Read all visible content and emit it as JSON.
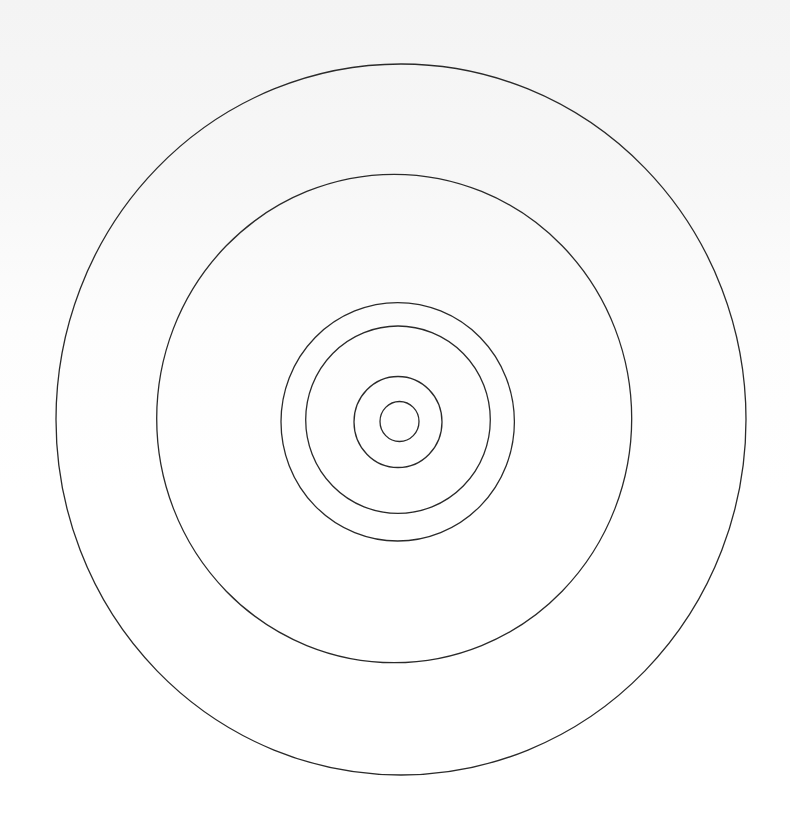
{
  "diagram": {
    "type": "concentric-circles",
    "stroke_color": "#2a2a2a",
    "background_color": "#ffffff",
    "rings": [
      {
        "name": "ring-1",
        "cx": 399.5,
        "cy": 421.5,
        "rx": 19.5,
        "ry": 20
      },
      {
        "name": "ring-2",
        "cx": 398,
        "cy": 422,
        "rx": 44,
        "ry": 45.5
      },
      {
        "name": "ring-3",
        "cx": 398,
        "cy": 419.7,
        "rx": 92.3,
        "ry": 93.7
      },
      {
        "name": "ring-4",
        "cx": 397.7,
        "cy": 421.8,
        "rx": 116.7,
        "ry": 119.2
      },
      {
        "name": "ring-5",
        "cx": 394.2,
        "cy": 418.5,
        "rx": 237.5,
        "ry": 244.2
      },
      {
        "name": "ring-6",
        "cx": 401,
        "cy": 419.5,
        "rx": 345,
        "ry": 355.5
      }
    ]
  }
}
